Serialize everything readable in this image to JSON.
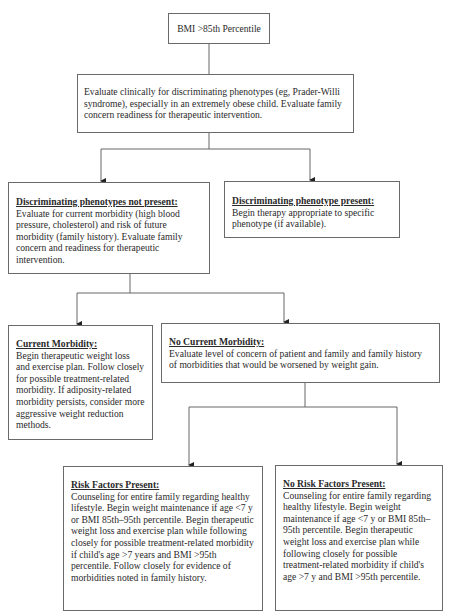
{
  "flowchart": {
    "nodes": {
      "start": {
        "text": "BMI >85th Percentile"
      },
      "evaluate": {
        "text": "Evaluate clinically for discriminating phenotypes (eg, Prader-Willi syndrome), especially in an extremely obese child. Evaluate family concern readiness for therapeutic intervention."
      },
      "not_present": {
        "title": "Discriminating phenotypes not present:",
        "text": "Evaluate for current morbidity (high blood pressure, cholesterol) and risk of future morbidity (family history). Evaluate family concern and readiness for therapeutic intervention."
      },
      "present": {
        "title": "Discriminating phenotype present:",
        "text": "Begin therapy appropriate to specific phenotype (if available)."
      },
      "current_morbidity": {
        "title": "Current Morbidity:",
        "text": "Begin therapeutic weight loss and exercise plan. Follow closely for possible treatment-related morbidity. If adiposity-related morbidity persists, consider more aggressive weight reduction methods."
      },
      "no_current_morbidity": {
        "title": "No Current Morbidity:",
        "text": "Evaluate level of concern of patient and family and family history of morbidities that would be worsened by weight gain."
      },
      "risk_factors": {
        "title": "Risk Factors Present:",
        "text": "Counseling for entire family regarding healthy lifestyle. Begin weight maintenance if age <7 y or BMI 85th–95th percentile. Begin therapeutic weight loss and exercise plan while following closely for possible treatment-related morbidity if child's age >7 years and BMI >95th percentile. Follow closely for evidence of morbidities noted in family history."
      },
      "no_risk_factors": {
        "title": "No Risk Factors Present:",
        "text": "Counseling for entire family regarding healthy lifestyle. Begin weight maintenance if age <7 y or BMI 85th–95th percentile. Begin therapeutic weight loss and exercise plan while following closely for possible treatment-related morbidity if child's age >7 y and BMI >95th percentile."
      }
    },
    "edges": [
      [
        "start",
        "evaluate"
      ],
      [
        "evaluate",
        "not_present"
      ],
      [
        "evaluate",
        "present"
      ],
      [
        "not_present",
        "current_morbidity"
      ],
      [
        "not_present",
        "no_current_morbidity"
      ],
      [
        "no_current_morbidity",
        "risk_factors"
      ],
      [
        "no_current_morbidity",
        "no_risk_factors"
      ]
    ],
    "colors": {
      "line": "#666666",
      "arrow": "#222222",
      "border": "#6a6a6a",
      "text": "#2a2a2a"
    }
  }
}
